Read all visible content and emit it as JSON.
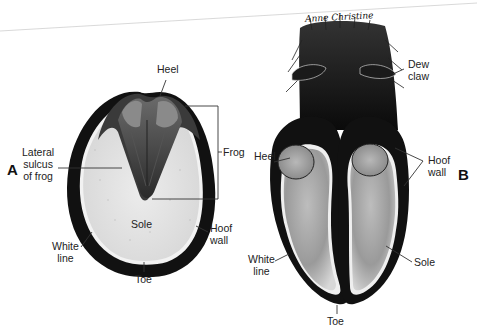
{
  "figure": {
    "panel_a": {
      "letter": "A",
      "title": "Equine hoof (ventral view)",
      "labels": {
        "heel": "Heel",
        "frog": "Frog",
        "lateral_sulcus": [
          "Lateral",
          "sulcus",
          "of frog"
        ],
        "sole": "Sole",
        "hoof_wall": [
          "Hoof",
          "wall"
        ],
        "white_line": [
          "White",
          "line"
        ],
        "toe": "Toe"
      }
    },
    "panel_b": {
      "letter": "B",
      "title": "Cloven hoof (ventral view)",
      "labels": {
        "dew_claw": [
          "Dew",
          "claw"
        ],
        "heel": "Heel",
        "hoof_wall": [
          "Hoof",
          "wall"
        ],
        "white_line": [
          "White",
          "line"
        ],
        "sole": "Sole",
        "toe": "Toe"
      }
    },
    "signature": "Anne Christine"
  },
  "colors": {
    "wall": "#111111",
    "sole": "#e4e4e4",
    "frog_dark": "#3a3a3a",
    "frog_mid": "#7a7a7a",
    "white_line": "#f4f4f4",
    "label": "#222222",
    "leader": "#333333"
  }
}
